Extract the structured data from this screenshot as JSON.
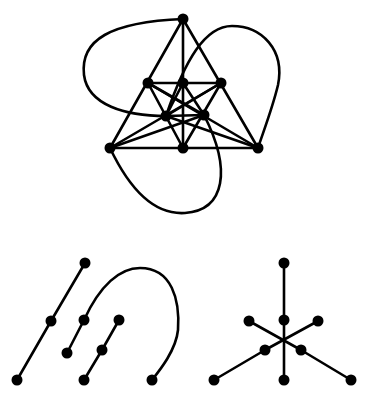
{
  "figure": {
    "background": "#ffffff",
    "stroke_color": "#000000",
    "node_color": "#000000",
    "node_radius": 5.5
  },
  "graphs": [
    {
      "name": "top-graph",
      "nodes": [
        {
          "id": "t0",
          "x": 183,
          "y": 19
        },
        {
          "id": "t1",
          "x": 148,
          "y": 83
        },
        {
          "id": "t2",
          "x": 183,
          "y": 83
        },
        {
          "id": "t3",
          "x": 221,
          "y": 83
        },
        {
          "id": "t4",
          "x": 166,
          "y": 116
        },
        {
          "id": "t5",
          "x": 204,
          "y": 115
        },
        {
          "id": "t6",
          "x": 110,
          "y": 148
        },
        {
          "id": "t7",
          "x": 183,
          "y": 148
        },
        {
          "id": "t8",
          "x": 258,
          "y": 148
        }
      ],
      "edges": [
        [
          "t0",
          "t6"
        ],
        [
          "t0",
          "t8"
        ],
        [
          "t0",
          "t7"
        ],
        [
          "t6",
          "t8"
        ],
        [
          "t1",
          "t3"
        ],
        [
          "t1",
          "t5"
        ],
        [
          "t3",
          "t4"
        ],
        [
          "t1",
          "t7"
        ],
        [
          "t3",
          "t7"
        ],
        [
          "t2",
          "t4"
        ],
        [
          "t2",
          "t5"
        ],
        [
          "t4",
          "t5"
        ],
        [
          "t6",
          "t5"
        ],
        [
          "t8",
          "t4"
        ],
        [
          "t6",
          "t3"
        ],
        [
          "t8",
          "t1"
        ]
      ],
      "curves": [
        "M183,19 C110,22 80,40 84,75 C88,105 125,116 166,116",
        "M166,116 C185,60 205,26 232,26 C262,26 285,50 278,85 C272,110 262,135 258,148",
        "M110,148 C130,190 155,215 185,213 C225,210 232,170 204,115"
      ]
    },
    {
      "name": "bottom-left-graph",
      "nodes": [
        {
          "id": "a0",
          "x": 85,
          "y": 263
        },
        {
          "id": "a1",
          "x": 51,
          "y": 321
        },
        {
          "id": "a2",
          "x": 17,
          "y": 380
        },
        {
          "id": "a3",
          "x": 84,
          "y": 320
        },
        {
          "id": "a4",
          "x": 67,
          "y": 353
        },
        {
          "id": "a5",
          "x": 119,
          "y": 320
        },
        {
          "id": "a6",
          "x": 102,
          "y": 350
        },
        {
          "id": "a7",
          "x": 84,
          "y": 380
        },
        {
          "id": "a8",
          "x": 152,
          "y": 380
        }
      ],
      "edges": [
        [
          "a0",
          "a1"
        ],
        [
          "a1",
          "a2"
        ],
        [
          "a3",
          "a4"
        ],
        [
          "a5",
          "a6"
        ],
        [
          "a6",
          "a7"
        ]
      ],
      "curves": [
        "M84,320 C100,285 120,268 140,268 C172,268 180,300 178,330 C176,350 160,370 152,380"
      ]
    },
    {
      "name": "bottom-right-graph",
      "nodes": [
        {
          "id": "b0",
          "x": 284,
          "y": 263
        },
        {
          "id": "b1",
          "x": 284,
          "y": 320
        },
        {
          "id": "b2",
          "x": 249,
          "y": 321
        },
        {
          "id": "b3",
          "x": 318,
          "y": 321
        },
        {
          "id": "b4",
          "x": 265,
          "y": 350
        },
        {
          "id": "b5",
          "x": 301,
          "y": 350
        },
        {
          "id": "b6",
          "x": 214,
          "y": 380
        },
        {
          "id": "b7",
          "x": 284,
          "y": 380
        },
        {
          "id": "b8",
          "x": 351,
          "y": 380
        }
      ],
      "edges": [
        [
          "b0",
          "b1"
        ],
        [
          "b1",
          "b7"
        ],
        [
          "b2",
          "b5"
        ],
        [
          "b5",
          "b8"
        ],
        [
          "b3",
          "b4"
        ],
        [
          "b4",
          "b6"
        ]
      ],
      "curves": []
    }
  ]
}
